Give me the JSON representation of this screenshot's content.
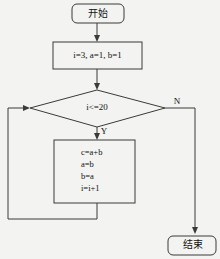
{
  "diagram": {
    "type": "flowchart",
    "title": "",
    "background_color": "#f3f3f1",
    "line_color": "#3a3a3a",
    "text_color": "#111111",
    "nodes": {
      "start": {
        "label": "开始",
        "shape": "rounded-rectangle"
      },
      "init": {
        "label": "i=3, a=1, b=1",
        "shape": "rectangle"
      },
      "decision": {
        "label": "i<=20",
        "shape": "diamond"
      },
      "process": {
        "shape": "rectangle",
        "lines": [
          "c=a+b",
          "a=b",
          "b=a",
          "i=i+1"
        ]
      },
      "end": {
        "label": "结束",
        "shape": "rounded-rectangle"
      }
    },
    "branch_labels": {
      "yes": "Y",
      "no": "N"
    }
  }
}
